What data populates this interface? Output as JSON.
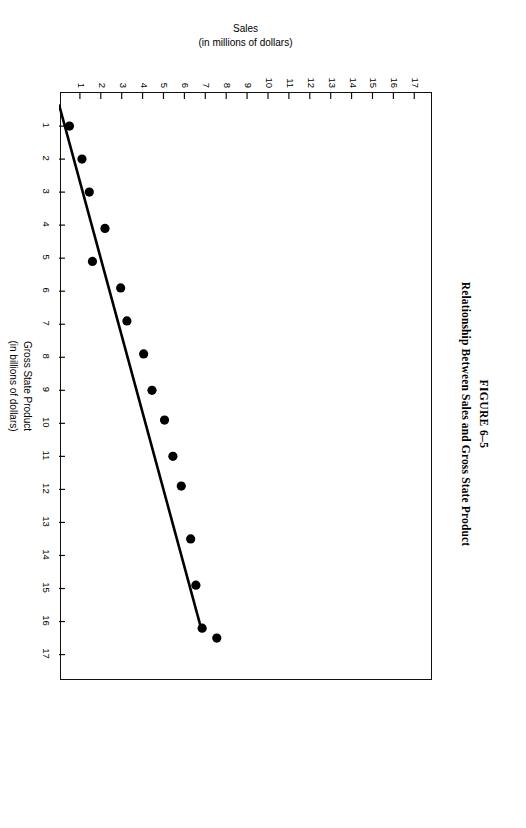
{
  "figure": {
    "number": "FIGURE 6–5",
    "title": "Relationship Between Sales and Gross State Product"
  },
  "chart_data": {
    "type": "scatter",
    "title": "Relationship Between Sales and Gross State Product",
    "xlabel": "Gross State Product",
    "xlabel_sub": "(in billions of dollars)",
    "ylabel": "Sales",
    "ylabel_sub": "(in millions of dollars)",
    "xlim": [
      0,
      17.8
    ],
    "ylim": [
      0,
      17.8
    ],
    "xticks": [
      1,
      2,
      3,
      4,
      5,
      6,
      7,
      8,
      9,
      10,
      11,
      12,
      13,
      14,
      15,
      16,
      17
    ],
    "yticks": [
      1,
      2,
      3,
      4,
      5,
      6,
      7,
      8,
      9,
      10,
      11,
      12,
      13,
      14,
      15,
      16,
      17
    ],
    "grid": false,
    "legend": false,
    "marker_color": "#000000",
    "line_color": "#000000",
    "frame_color": "#111111",
    "series": [
      {
        "name": "Sales vs Gross State Product",
        "points": [
          [
            1.0,
            0.5
          ],
          [
            2.0,
            1.1
          ],
          [
            3.0,
            1.45
          ],
          [
            4.1,
            2.2
          ],
          [
            5.1,
            1.6
          ],
          [
            5.9,
            2.95
          ],
          [
            6.9,
            3.25
          ],
          [
            7.9,
            4.05
          ],
          [
            9.0,
            4.45
          ],
          [
            9.9,
            5.05
          ],
          [
            11.0,
            5.45
          ],
          [
            11.9,
            5.85
          ],
          [
            13.5,
            6.3
          ],
          [
            14.9,
            6.55
          ],
          [
            16.2,
            6.85
          ],
          [
            16.5,
            7.55
          ]
        ]
      }
    ],
    "regression_line": {
      "name": "fitted line",
      "x1": 0.35,
      "y1": 0.0,
      "x2": 16.25,
      "y2": 6.82
    }
  }
}
